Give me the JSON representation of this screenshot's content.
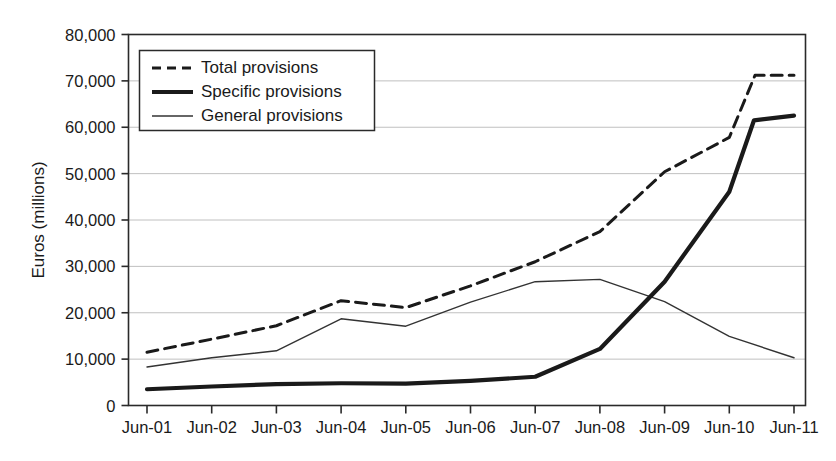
{
  "chart_data": {
    "type": "line",
    "title": "",
    "xlabel": "",
    "ylabel": "Euros (millions)",
    "x": [
      "Jun-01",
      "Jun-02",
      "Jun-03",
      "Jun-04",
      "Jun-05",
      "Jun-06",
      "Jun-07",
      "Jun-08",
      "Jun-09",
      "Jun-10",
      "Jun-11"
    ],
    "categories": [
      "Jun-01",
      "Jun-02",
      "Jun-03",
      "Jun-04",
      "Jun-05",
      "Jun-06",
      "Jun-07",
      "Jun-08",
      "Jun-09",
      "Jun-10",
      "Jun-11"
    ],
    "ylim": [
      0,
      80000
    ],
    "ytick_labels": [
      "0",
      "10,000",
      "20,000",
      "30,000",
      "40,000",
      "50,000",
      "60,000",
      "70,000",
      "80,000"
    ],
    "ytick_values": [
      0,
      10000,
      20000,
      30000,
      40000,
      50000,
      60000,
      70000,
      80000
    ],
    "grid": true,
    "grid_axis": "y",
    "legend_position": "upper-left-inside",
    "series": [
      {
        "name": "Total provisions",
        "style": "dashed",
        "color": "#1a1a1a",
        "width": 3,
        "values": [
          11500,
          14300,
          17200,
          22600,
          21100,
          25800,
          31000,
          37500,
          50400,
          57800,
          71200
        ]
      },
      {
        "name": "Specific provisions",
        "style": "solid-thick",
        "color": "#1a1a1a",
        "width": 4.2,
        "values": [
          3500,
          4100,
          4600,
          4800,
          4700,
          5300,
          6200,
          12200,
          26700,
          46100,
          61500
        ]
      },
      {
        "name": "General provisions",
        "style": "solid-thin",
        "color": "#333333",
        "width": 1.4,
        "values": [
          8300,
          10300,
          11800,
          18700,
          17100,
          22300,
          26700,
          27200,
          22400,
          14900,
          10300
        ]
      }
    ],
    "extra_points": {
      "note_total_plateau": 71200,
      "note_specific_final": 62500,
      "specific_final_value": 62500,
      "total_final_value": 71200,
      "general_final_value": 10300
    }
  },
  "legend": {
    "items": [
      {
        "label": "Total provisions",
        "marker": "dashed-line"
      },
      {
        "label": "Specific provisions",
        "marker": "thick-solid-line"
      },
      {
        "label": "General provisions",
        "marker": "thin-solid-line"
      }
    ]
  },
  "axes": {
    "y_title": "Euros (millions)"
  }
}
